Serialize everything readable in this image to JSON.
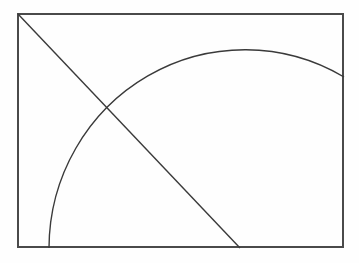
{
  "document": {
    "title": "Geometric diagram",
    "description": "Rectangle containing a descending diagonal line and a broad elliptical arc crossing it"
  },
  "canvas": {
    "width": 359,
    "height": 263,
    "background_color": "#fefefe"
  },
  "style": {
    "stroke_color": "#3a3a3a",
    "border_color": "#4a4a4a",
    "border_width": 2,
    "line_width": 1.4,
    "arc_width": 1.4
  },
  "figure": {
    "type": "diagram",
    "shapes": [
      {
        "name": "bounding-rectangle",
        "kind": "rectangle",
        "x": 17,
        "y": 13,
        "width": 327,
        "height": 235,
        "corners": [
          [
            17,
            13
          ],
          [
            344,
            13
          ],
          [
            344,
            248
          ],
          [
            17,
            248
          ]
        ],
        "stroke": "#4a4a4a",
        "stroke_width": 2,
        "fill": "none"
      },
      {
        "name": "diagonal-line",
        "kind": "line",
        "start": [
          18,
          14
        ],
        "end": [
          240,
          248
        ],
        "stroke": "#3a3a3a",
        "stroke_width": 1.4
      },
      {
        "name": "elliptical-arc",
        "kind": "arc",
        "center": [
          245,
          248
        ],
        "radius_x": 196,
        "radius_y": 199,
        "start_point": [
          49,
          248
        ],
        "apex_point": [
          245,
          49
        ],
        "end_point": [
          344,
          77
        ],
        "path": "M 49 248 A 196 199 0 0 1 344 77",
        "stroke": "#3a3a3a",
        "stroke_width": 1.4,
        "fill": "none"
      }
    ],
    "intersections": [
      {
        "name": "line-arc-crossing",
        "point": [
          107,
          106
        ]
      },
      {
        "name": "arc-bottom-foot",
        "point": [
          49,
          248
        ]
      },
      {
        "name": "line-bottom-foot",
        "point": [
          240,
          248
        ]
      },
      {
        "name": "arc-right-edge",
        "point": [
          344,
          77
        ]
      }
    ]
  },
  "labels": {
    "text_items": []
  }
}
